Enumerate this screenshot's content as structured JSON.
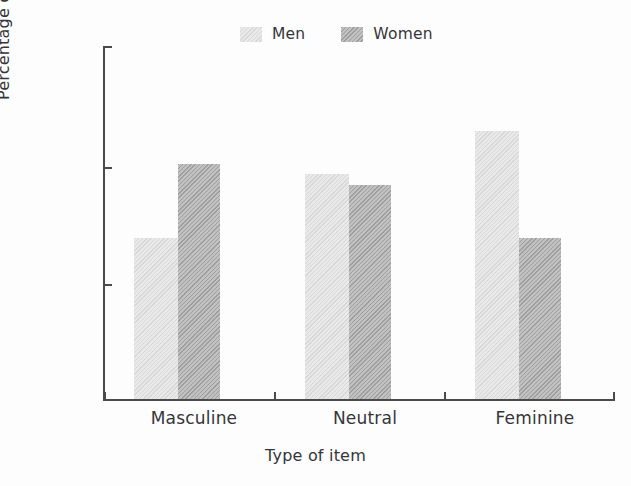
{
  "chart_data": {
    "type": "bar",
    "title": "",
    "subtitle": "",
    "xlabel": "Type of item",
    "ylabel": "Percentage conforming",
    "categories": [
      "Masculine",
      "Neutral",
      "Feminine"
    ],
    "series": [
      {
        "name": "Men",
        "values": [
          33.7,
          39.2,
          42.8
        ],
        "color": "#e9e9e9"
      },
      {
        "name": "Women",
        "values": [
          40.0,
          38.2,
          33.7
        ],
        "color": "#b6b6b6"
      }
    ],
    "ylim": [
      20,
      50
    ],
    "yticks": [
      20,
      30,
      40,
      50
    ],
    "ytick_labels": [
      "20",
      "30",
      "40",
      "50"
    ],
    "xlim_categories": 3,
    "grid": false,
    "legend_position": "top-center",
    "legend_entries": [
      "Men",
      "Women"
    ],
    "axis_color": "#4a4a4a",
    "background_color": "#fdfdfd"
  },
  "legend": {
    "items": [
      {
        "label": "Men",
        "swatch": "men-swatch"
      },
      {
        "label": "Women",
        "swatch": "women-swatch"
      }
    ]
  },
  "axes": {
    "y_title": "Percentage conforming",
    "x_title": "Type of item",
    "y_ticks": [
      "50",
      "40",
      "30",
      "20"
    ],
    "x_categories": [
      "Masculine",
      "Neutral",
      "Feminine"
    ]
  }
}
